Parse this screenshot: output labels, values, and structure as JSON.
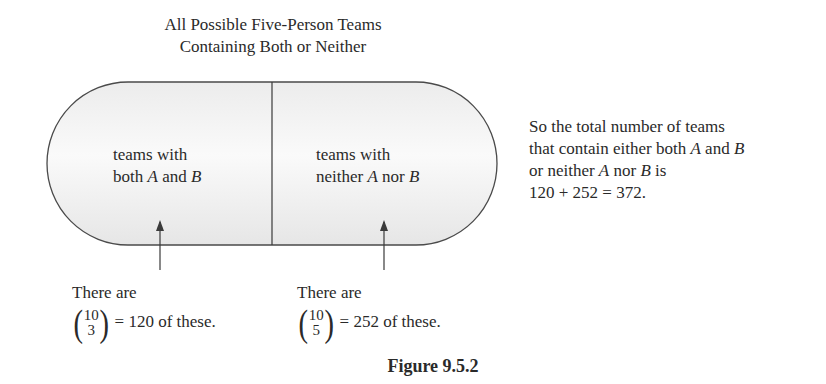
{
  "title": {
    "line1": "All Possible Five-Person Teams",
    "line2": "Containing Both or Neither"
  },
  "regions": [
    {
      "line1": "teams with",
      "line2_pre": "both ",
      "var1": "A",
      "mid": " and ",
      "var2": "B"
    },
    {
      "line1": "teams with",
      "line2_pre": "neither ",
      "var1": "A",
      "mid": " nor ",
      "var2": "B"
    }
  ],
  "counts": [
    {
      "intro": "There are",
      "n": "10",
      "k": "3",
      "result": "= 120 of these."
    },
    {
      "intro": "There are",
      "n": "10",
      "k": "5",
      "result": "= 252 of these."
    }
  ],
  "summary": {
    "line1": "So the total number of teams",
    "line2_pre": "that contain either both ",
    "line2_var1": "A",
    "line2_mid": " and ",
    "line2_var2": "B",
    "line3_pre": "or neither ",
    "line3_var1": "A",
    "line3_mid": " nor ",
    "line3_var2": "B",
    "line3_post": " is",
    "line4": "120 + 252 = 372."
  },
  "caption": "Figure 9.5.2",
  "colors": {
    "stroke": "#4a4a4a",
    "fill_light": "#f7f7f7",
    "fill_dark": "#e4e4e4",
    "text": "#2a2a2a"
  }
}
